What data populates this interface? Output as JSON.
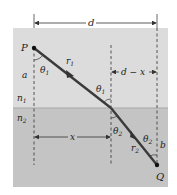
{
  "diagram": {
    "colors": {
      "upper_medium": "#dcdcdc",
      "lower_medium": "#c4c4c4",
      "frame_border": "#b5b5b5",
      "ray": "#3a3a3a",
      "dashed": "#444444"
    },
    "labels": {
      "d": "d",
      "d_minus_x": "d − x",
      "P": "P",
      "Q": "Q",
      "a": "a",
      "b": "b",
      "x": "x",
      "n1": "n",
      "n1_sub": "1",
      "n2": "n",
      "n2_sub": "2",
      "r1": "r",
      "r1_sub": "1",
      "r2": "r",
      "r2_sub": "2",
      "theta1_at_P": "θ",
      "theta1_at_P_sub": "1",
      "theta1_at_interface": "θ",
      "theta1_at_interface_sub": "1",
      "theta2_at_interface": "θ",
      "theta2_at_interface_sub": "2",
      "theta2_at_Q": "θ",
      "theta2_at_Q_sub": "2"
    }
  }
}
